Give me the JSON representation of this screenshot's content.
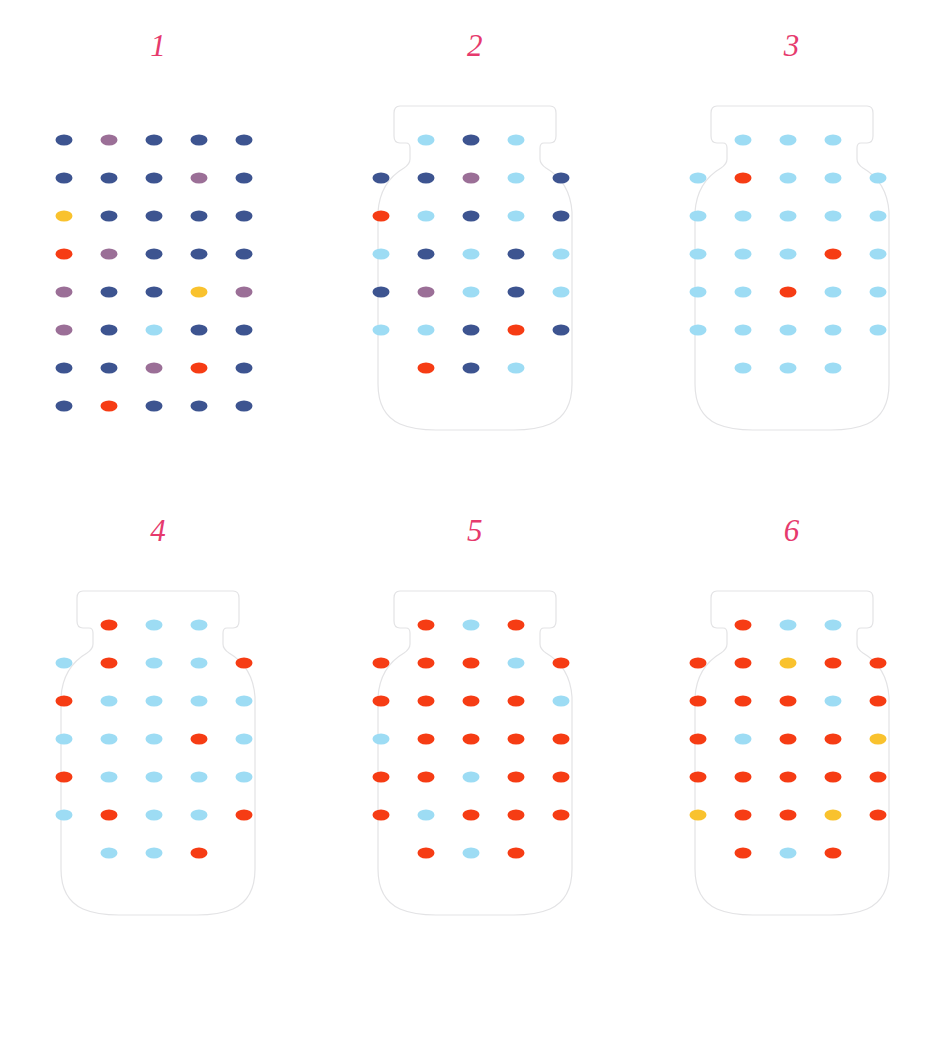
{
  "page": {
    "background_color": "#ffffff",
    "label_color": "#e63a6d",
    "jar_outline_color": "#e3e3e5"
  },
  "palette": {
    "navy": "#3d5490",
    "purple": "#9b6f97",
    "lightblue": "#9ddcf4",
    "red": "#f63c14",
    "yellow": "#f9c22e"
  },
  "legend": {
    "navy_name": "dark-blue",
    "purple_name": "purple",
    "lightblue_name": "light-blue",
    "red_name": "red-orange",
    "yellow_name": "yellow"
  },
  "grid": {
    "columns": 5,
    "rows": 8,
    "col_x": [
      17,
      62,
      107,
      152,
      197
    ],
    "row_y": [
      38,
      76,
      114,
      152,
      190,
      228,
      266,
      304
    ],
    "narrow_rows": [
      0,
      7
    ],
    "narrow_columns": [
      1,
      2,
      3
    ]
  },
  "panels": [
    {
      "label": "1",
      "has_jar": false,
      "full_grid": true,
      "dots": [
        [
          "navy",
          "purple",
          "navy",
          "navy",
          "navy"
        ],
        [
          "navy",
          "navy",
          "navy",
          "purple",
          "navy"
        ],
        [
          "yellow",
          "navy",
          "navy",
          "navy",
          "navy"
        ],
        [
          "red",
          "purple",
          "navy",
          "navy",
          "navy"
        ],
        [
          "purple",
          "navy",
          "navy",
          "yellow",
          "purple"
        ],
        [
          "purple",
          "navy",
          "lightblue",
          "navy",
          "navy"
        ],
        [
          "navy",
          "navy",
          "purple",
          "red",
          "navy"
        ],
        [
          "navy",
          "red",
          "navy",
          "navy",
          "navy"
        ]
      ]
    },
    {
      "label": "2",
      "has_jar": true,
      "full_grid": false,
      "dots": [
        [
          null,
          "lightblue",
          "navy",
          "lightblue",
          null
        ],
        [
          "navy",
          "navy",
          "purple",
          "lightblue",
          "navy"
        ],
        [
          "red",
          "lightblue",
          "navy",
          "lightblue",
          "navy"
        ],
        [
          "lightblue",
          "navy",
          "lightblue",
          "navy",
          "lightblue"
        ],
        [
          "navy",
          "purple",
          "lightblue",
          "navy",
          "lightblue"
        ],
        [
          "lightblue",
          "lightblue",
          "navy",
          "red",
          "navy"
        ],
        [
          null,
          "red",
          "navy",
          "lightblue",
          null
        ]
      ]
    },
    {
      "label": "3",
      "has_jar": true,
      "full_grid": false,
      "dots": [
        [
          null,
          "lightblue",
          "lightblue",
          "lightblue",
          null
        ],
        [
          "lightblue",
          "red",
          "lightblue",
          "lightblue",
          "lightblue"
        ],
        [
          "lightblue",
          "lightblue",
          "lightblue",
          "lightblue",
          "lightblue"
        ],
        [
          "lightblue",
          "lightblue",
          "lightblue",
          "red",
          "lightblue"
        ],
        [
          "lightblue",
          "lightblue",
          "red",
          "lightblue",
          "lightblue"
        ],
        [
          "lightblue",
          "lightblue",
          "lightblue",
          "lightblue",
          "lightblue"
        ],
        [
          null,
          "lightblue",
          "lightblue",
          "lightblue",
          null
        ]
      ]
    },
    {
      "label": "4",
      "has_jar": true,
      "full_grid": false,
      "dots": [
        [
          null,
          "red",
          "lightblue",
          "lightblue",
          null
        ],
        [
          "lightblue",
          "red",
          "lightblue",
          "lightblue",
          "red"
        ],
        [
          "red",
          "lightblue",
          "lightblue",
          "lightblue",
          "lightblue"
        ],
        [
          "lightblue",
          "lightblue",
          "lightblue",
          "red",
          "lightblue"
        ],
        [
          "red",
          "lightblue",
          "lightblue",
          "lightblue",
          "lightblue"
        ],
        [
          "lightblue",
          "red",
          "lightblue",
          "lightblue",
          "red"
        ],
        [
          null,
          "lightblue",
          "lightblue",
          "red",
          null
        ]
      ]
    },
    {
      "label": "5",
      "has_jar": true,
      "full_grid": false,
      "dots": [
        [
          null,
          "red",
          "lightblue",
          "red",
          null
        ],
        [
          "red",
          "red",
          "red",
          "lightblue",
          "red"
        ],
        [
          "red",
          "red",
          "red",
          "red",
          "lightblue"
        ],
        [
          "lightblue",
          "red",
          "red",
          "red",
          "red"
        ],
        [
          "red",
          "red",
          "lightblue",
          "red",
          "red"
        ],
        [
          "red",
          "lightblue",
          "red",
          "red",
          "red"
        ],
        [
          null,
          "red",
          "lightblue",
          "red",
          null
        ]
      ]
    },
    {
      "label": "6",
      "has_jar": true,
      "full_grid": false,
      "dots": [
        [
          null,
          "red",
          "lightblue",
          "lightblue",
          null
        ],
        [
          "red",
          "red",
          "yellow",
          "red",
          "red"
        ],
        [
          "red",
          "red",
          "red",
          "lightblue",
          "red"
        ],
        [
          "red",
          "lightblue",
          "red",
          "red",
          "yellow"
        ],
        [
          "red",
          "red",
          "red",
          "red",
          "red"
        ],
        [
          "yellow",
          "red",
          "red",
          "yellow",
          "red"
        ],
        [
          null,
          "red",
          "lightblue",
          "red",
          null
        ]
      ]
    }
  ]
}
